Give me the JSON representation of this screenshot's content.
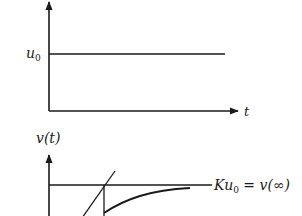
{
  "top_graph": {
    "y_level_label": "u",
    "y_level_sub": "0",
    "x_axis_label": "t"
  },
  "bottom_graph": {
    "y_axis_label": "v(t)",
    "asymptote_label_K": "Ku",
    "asymptote_label_sub": "0",
    "asymptote_label_rest": " = v(∞)"
  },
  "colors": {
    "stroke": "#1a1a1a",
    "background": "#ffffff"
  }
}
